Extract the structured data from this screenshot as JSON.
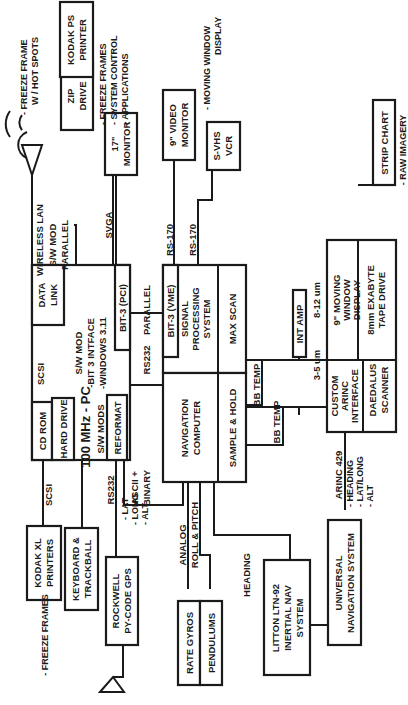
{
  "diagram": {
    "orientation": "rotated 90 degrees counter-clockwise",
    "nodes": {
      "pc": {
        "title": "100 MHz - PC",
        "lines": [
          "S/W MOD",
          "-BIT 3 INTFACE",
          "-WINDOWS 3.11"
        ]
      },
      "cd_rom": {
        "label": "CD ROM"
      },
      "hard_drive": {
        "label": "HARD DRIVE"
      },
      "sw_mods": {
        "label": "S/W MODS"
      },
      "reformat": {
        "label": "REFORMAT"
      },
      "scsi_internal": {
        "label": "SCSI"
      },
      "data_link": {
        "lines": [
          "DATA",
          "LINK"
        ]
      },
      "bit3_pci": {
        "label": "BIT-3 (PCI)"
      },
      "bit3_vme": {
        "label": "BIT-3 (VME)"
      },
      "signal_processing": {
        "lines": [
          "SIGNAL",
          "PROCESSING",
          "SYSTEM"
        ]
      },
      "max_scan": {
        "label": "MAX SCAN"
      },
      "navigation_computer": {
        "lines": [
          "NAVIGATION",
          "COMPUTER"
        ]
      },
      "sample_hold": {
        "label": "SAMPLE & HOLD"
      },
      "int_amp": {
        "label": "INT AMP"
      },
      "moving_window_display": {
        "lines": [
          "9\" MOVING",
          "WINDOW",
          "DISPLAY"
        ]
      },
      "exabyte": {
        "lines": [
          "8mm EXABYTE",
          "TAPE DRIVE"
        ]
      },
      "custom_arinc": {
        "lines": [
          "CUSTOM",
          "ARINC",
          "INTERFACE"
        ]
      },
      "daedalus": {
        "lines": [
          "DAEDALUS",
          "SCANNER"
        ]
      },
      "strip_chart": {
        "label": "STRIP CHART"
      },
      "svhs_vcr": {
        "lines": [
          "S-VHS",
          "VCR"
        ]
      },
      "video_monitor": {
        "lines": [
          "9\" VIDEO",
          "MONITOR"
        ]
      },
      "monitor_17": {
        "lines": [
          "17\"",
          "MONITOR"
        ]
      },
      "zip_drive": {
        "lines": [
          "ZIP",
          "DRIVE"
        ]
      },
      "kodak_ps": {
        "lines": [
          "KODAK PS",
          "PRINTER"
        ]
      },
      "kodak_xl": {
        "lines": [
          "KODAK XL",
          "PRINTERS"
        ]
      },
      "keyboard": {
        "lines": [
          "KEYBOARD &",
          "TRACKBALL"
        ]
      },
      "rockwell_gps": {
        "lines": [
          "ROCKWELL",
          "PY-CODE GPS"
        ]
      },
      "rate_gyros": {
        "label": "RATE GYROS"
      },
      "pendulums": {
        "label": "PENDULUMS"
      },
      "litton": {
        "lines": [
          "LITTON LTN-92",
          "INERTIAL NAV",
          "SYSTEM"
        ]
      },
      "universal_nav": {
        "lines": [
          "UNIVERSAL",
          "NAVIGATION SYSTEM"
        ]
      }
    },
    "connection_labels": {
      "wireless_lan": "WIRELESS LAN",
      "sw_mod": "S/W MOD",
      "parallel_top": "PARALLEL",
      "svga": "SVGA",
      "parallel_mid": "PARALLEL",
      "rs170_a": "RS-170",
      "rs170_b": "RS-170",
      "rs232_mid": "RS232",
      "ascii_binary": [
        "ASCII +",
        "BINARY"
      ],
      "bb_temp_a": "BB TEMP",
      "bb_temp_b": "BB TEMP",
      "um_8_12": "8-12 um",
      "um_3_5": "3-5 um",
      "scsi_ext": "SCSI",
      "rs232_gps": "RS232",
      "analog": "ANALOG",
      "roll_pitch": "ROLL & PITCH",
      "heading": "HEADING",
      "arinc429": "ARINC 429"
    },
    "notes": {
      "freeze_hot": [
        "- FREEZE FRAME",
        "W / HOT SPOTS"
      ],
      "zip_notes": [
        "- FREEZE FRAMES",
        "- SYSTEM CONTROL",
        "- APPLICATIONS"
      ],
      "moving_window": [
        "- MOVING WINDOW",
        "DISPLAY"
      ],
      "raw_imagery": "- RAW IMAGERY",
      "freeze_frames": "- FREEZE FRAMES",
      "gps_data": [
        "- LAT",
        "- LONG",
        "- ALT"
      ],
      "arinc_data": [
        "- HEADING",
        "- LAT/LONG",
        "- ALT"
      ]
    }
  }
}
